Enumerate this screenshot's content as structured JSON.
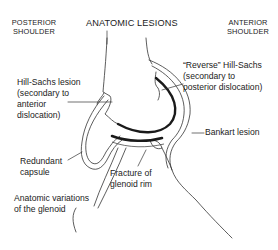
{
  "title": "ANATOMIC LESIONS",
  "headers": {
    "left": [
      "POSTERIOR",
      "SHOULDER"
    ],
    "right": [
      "ANTERIOR",
      "SHOULDER"
    ]
  },
  "labels": {
    "hill_sachs": [
      "Hill-Sachs lesion",
      "(secondary to",
      "anterior",
      "dislocation)"
    ],
    "reverse_hill_sachs": [
      "“Reverse” Hill-Sachs",
      "(secondary to",
      "posterior dislocation)"
    ],
    "bankart": "Bankart lesion",
    "redundant_capsule": [
      "Redundant",
      "capsule"
    ],
    "fracture_glenoid_rim": [
      "Fracture of",
      "glenoid rim"
    ],
    "anatomic_variations": [
      "Anatomic variations",
      "of the glenoid"
    ]
  },
  "colors": {
    "ink": "#222222",
    "cartilage": "#1a1a1a",
    "background": "#ffffff"
  }
}
